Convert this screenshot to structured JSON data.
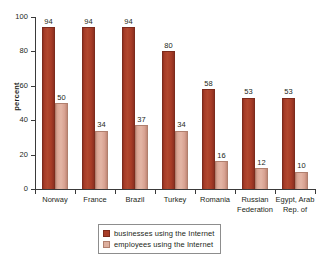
{
  "chart_data": {
    "type": "bar",
    "title": "",
    "xlabel": "",
    "ylabel": "percent",
    "ylim": [
      0,
      100
    ],
    "yticks": [
      0,
      20,
      40,
      60,
      80,
      100
    ],
    "grid": false,
    "legend_position": "bottom-center",
    "categories": [
      "Norway",
      "France",
      "Brazil",
      "Turkey",
      "Romania",
      "Russian\nFederation",
      "Egypt, Arab\nRep. of"
    ],
    "series": [
      {
        "name": "businesses using the Internet",
        "color": "#a83d28",
        "values": [
          94,
          94,
          94,
          80,
          58,
          53,
          53
        ]
      },
      {
        "name": "employees using the Internet",
        "color": "#ddaf9e",
        "values": [
          50,
          34,
          37,
          34,
          16,
          12,
          10
        ]
      }
    ]
  }
}
